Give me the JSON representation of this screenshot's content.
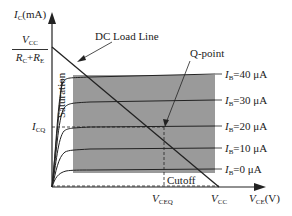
{
  "diagram": {
    "y_axis": {
      "symbol": "I",
      "sub": "C",
      "unit": "(mA)"
    },
    "x_axis": {
      "symbol": "V",
      "sub": "CE",
      "unit": "(V)"
    },
    "y_intercept": {
      "numerator": {
        "symbol": "V",
        "sub": "CC"
      },
      "denominator": {
        "a": "R",
        "a_sub": "C",
        "op": "+",
        "b": "R",
        "b_sub": "E"
      }
    },
    "x_intercept": {
      "symbol": "V",
      "sub": "CC"
    },
    "icq_label": {
      "symbol": "I",
      "sub": "CQ"
    },
    "vceq_label": {
      "symbol": "V",
      "sub": "CEQ"
    },
    "load_line_label": "DC Load Line",
    "q_point_label": "Q-point",
    "saturation_label": "Saturation",
    "cutoff_label": "Cutoff",
    "curves": [
      {
        "symbol": "I",
        "sub": "B",
        "value": "=40 μA"
      },
      {
        "symbol": "I",
        "sub": "B",
        "value": "=30 μA"
      },
      {
        "symbol": "I",
        "sub": "B",
        "value": "=20 μA"
      },
      {
        "symbol": "I",
        "sub": "B",
        "value": "=10 μA"
      },
      {
        "symbol": "I",
        "sub": "B",
        "value": "=0 μA"
      }
    ],
    "colors": {
      "active_region": "#9a9a9a",
      "line": "#222222"
    }
  }
}
